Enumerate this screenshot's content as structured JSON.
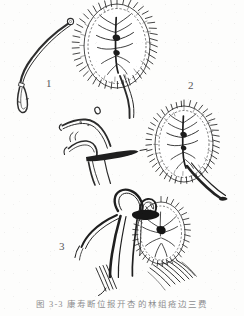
{
  "plate": {
    "width": 244,
    "height": 316,
    "background_color": "#fdfdfc",
    "ink_color": "#2b2b2b",
    "label_color": "#58585a",
    "caption_color": "#8d8d90"
  },
  "labels": {
    "one": "1",
    "two": "2",
    "three": "3"
  },
  "caption": {
    "figure_number": "图 3-3",
    "text": "图 3-3   康寿断位报开杏的林组疮边三费",
    "note_clipped": "caption baseline clipped at page edge"
  },
  "figures": [
    {
      "id": "figure-1",
      "label": "1",
      "description": "slender curved stalk with small terminal ring and elongated narrow loop at base",
      "position": {
        "x": 14,
        "y": 14,
        "width": 60,
        "height": 100
      }
    },
    {
      "id": "figure-2-upper",
      "label": "2",
      "description": "ovate bristly seed body with radiating marginal hairs, central vein and branched veinlets, stalk descending to lower right",
      "position": {
        "x": 78,
        "y": 2,
        "width": 84,
        "height": 102
      }
    },
    {
      "id": "figure-2-lower",
      "label": "2",
      "description": "second ovate bristly seed body with radiating marginal hairs and thick stalk to lower right",
      "position": {
        "x": 142,
        "y": 100,
        "width": 86,
        "height": 98
      }
    },
    {
      "id": "figure-hook",
      "label": "",
      "description": "curved claw-like hook structure with blunt apex and dark thickened band",
      "position": {
        "x": 56,
        "y": 108,
        "width": 82,
        "height": 78
      }
    },
    {
      "id": "figure-3",
      "label": "3",
      "description": "looped strap structure crossing a bristly radiating seed body, with attached stalks",
      "position": {
        "x": 70,
        "y": 186,
        "width": 124,
        "height": 112
      }
    }
  ],
  "icons": {
    "figure_plate": "botanical-specimen-plate"
  }
}
